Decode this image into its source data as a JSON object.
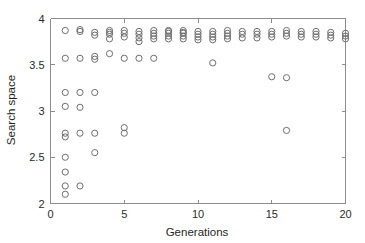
{
  "chart_data": {
    "type": "scatter",
    "title": "",
    "xlabel": "Generations",
    "ylabel": "Search space",
    "xlim": [
      0,
      20
    ],
    "ylim": [
      2,
      4
    ],
    "xticks": [
      0,
      5,
      10,
      15,
      20
    ],
    "yticks": [
      2,
      2.5,
      3,
      3.5,
      4
    ],
    "xticklabels": [
      "0",
      "5",
      "10",
      "15",
      "20"
    ],
    "yticklabels": [
      "2",
      "2.5",
      "3",
      "3.5",
      "4"
    ],
    "grid": false,
    "legend": null,
    "marker": {
      "shape": "circle-open",
      "edge_color": "#6e6e6e",
      "fill": "none",
      "radius_px": 3.1,
      "stroke_width": 1
    },
    "axis_color": "#8d8d8d",
    "background_color": "#ffffff",
    "series": [
      {
        "name": "Search space samples",
        "x": [
          1,
          1,
          1,
          1,
          1,
          1,
          1,
          1,
          1,
          1,
          2,
          2,
          2,
          2,
          2,
          2,
          2,
          3,
          3,
          3,
          3,
          3,
          3,
          3,
          4,
          4,
          4,
          4,
          4,
          5,
          5,
          5,
          5,
          5,
          5,
          6,
          6,
          6,
          6,
          6,
          7,
          7,
          7,
          7,
          7,
          8,
          8,
          8,
          8,
          8,
          9,
          9,
          9,
          9,
          9,
          10,
          10,
          10,
          10,
          11,
          11,
          11,
          11,
          11,
          12,
          12,
          12,
          12,
          13,
          13,
          13,
          14,
          14,
          14,
          15,
          15,
          15,
          15,
          16,
          16,
          16,
          16,
          16,
          17,
          17,
          17,
          18,
          18,
          18,
          19,
          19,
          19,
          20,
          20,
          20
        ],
        "y": [
          3.87,
          3.57,
          3.2,
          3.05,
          2.76,
          2.72,
          2.5,
          2.34,
          2.19,
          2.1,
          3.88,
          3.57,
          3.2,
          3.04,
          2.76,
          2.19,
          3.86,
          3.85,
          3.82,
          3.59,
          3.56,
          3.2,
          2.76,
          2.55,
          3.87,
          3.83,
          3.78,
          3.62,
          3.85,
          3.87,
          3.84,
          3.8,
          3.57,
          2.82,
          2.76,
          3.86,
          3.83,
          3.79,
          3.75,
          3.57,
          3.87,
          3.84,
          3.81,
          3.78,
          3.57,
          3.87,
          3.84,
          3.81,
          3.78,
          3.86,
          3.87,
          3.84,
          3.81,
          3.78,
          3.85,
          3.86,
          3.83,
          3.8,
          3.77,
          3.86,
          3.83,
          3.8,
          3.77,
          3.52,
          3.87,
          3.84,
          3.81,
          3.78,
          3.86,
          3.83,
          3.79,
          3.86,
          3.83,
          3.79,
          3.86,
          3.83,
          3.8,
          3.37,
          3.87,
          3.84,
          3.81,
          3.36,
          2.79,
          3.86,
          3.83,
          3.8,
          3.86,
          3.83,
          3.8,
          3.85,
          3.82,
          3.79,
          3.84,
          3.81,
          3.78
        ]
      }
    ]
  }
}
